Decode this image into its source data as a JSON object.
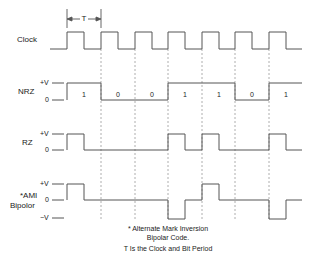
{
  "period_label": "T",
  "rows": {
    "clock": {
      "label": "Clock"
    },
    "nrz": {
      "label": "NRZ",
      "levels": [
        "+V",
        "0"
      ]
    },
    "rz": {
      "label": "RZ",
      "levels": [
        "+V",
        "0"
      ]
    },
    "ami": {
      "label_line1": "*AMI",
      "label_line2": "Bipolor",
      "levels": [
        "+V",
        "0",
        "−V"
      ]
    }
  },
  "bits": [
    "1",
    "0",
    "0",
    "1",
    "1",
    "0",
    "1"
  ],
  "notes": {
    "line1": "* Alternate Mark Inversion",
    "line2": "Bipolar Code.",
    "line3": "T Is the Clock and Bit Period"
  },
  "colors": {
    "stroke": "#555555",
    "dashed": "#9a9a9a",
    "text": "#222222"
  }
}
